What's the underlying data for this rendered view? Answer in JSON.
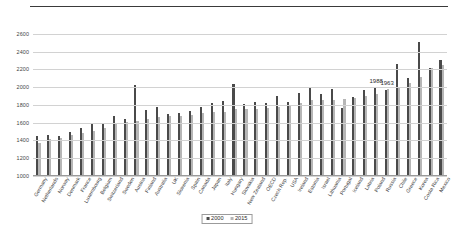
{
  "chart_data": {
    "type": "bar",
    "title": "",
    "subtitle": "",
    "xlabel": "",
    "ylabel": "",
    "ylim": [
      1000,
      2700
    ],
    "yticks": [
      1000,
      1200,
      1400,
      1600,
      1800,
      2000,
      2200,
      2400,
      2600
    ],
    "ytick_labels": [
      "1000",
      "1200",
      "1400",
      "1600",
      "1800",
      "2000",
      "2200",
      "2400",
      "2600"
    ],
    "grid": "horizontal",
    "legend_position": "bottom-center",
    "categories": [
      "Germany",
      "Netherlands",
      "Norway",
      "Denmark",
      "France",
      "Luxembourg",
      "Belgium",
      "Switzerland",
      "Sweden",
      "Austria",
      "Finland",
      "Australia",
      "UK",
      "Slovenia",
      "Spain",
      "Canada",
      "Japan",
      "Italy",
      "Hungary",
      "Slovakia",
      "New Zealand",
      "OECD",
      "Czech Rep.",
      "USA",
      "Ireland",
      "Estonia",
      "Israel",
      "Lithuania",
      "Portugal",
      "Iceland",
      "Latvia",
      "Poland",
      "Russia",
      "Chile",
      "Greece",
      "Korea",
      "Costa Rica",
      "Mexico"
    ],
    "series": [
      {
        "name": "2000",
        "color": "#4a4a4a",
        "values": [
          1452,
          1463,
          1455,
          1491,
          1535,
          1601,
          1595,
          1673,
          1642,
          2020,
          1744,
          1778,
          1700,
          1705,
          1731,
          1779,
          1821,
          1849,
          2033,
          1816,
          1836,
          1821,
          1896,
          1832,
          1933,
          1990,
          1920,
          1982,
          1769,
          1885,
          1974,
          1988,
          1963,
          2263,
          2098,
          2512,
          2216,
          2311
        ]
      },
      {
        "name": "2015",
        "color": "#b6b6b6",
        "values": [
          1371,
          1419,
          1424,
          1457,
          1482,
          1507,
          1541,
          1590,
          1612,
          1625,
          1646,
          1665,
          1674,
          1676,
          1691,
          1706,
          1719,
          1725,
          1749,
          1754,
          1757,
          1766,
          1779,
          1790,
          1820,
          1852,
          1858,
          1860,
          1868,
          1880,
          1903,
          1928,
          1978,
          1988,
          2042,
          2113,
          2216,
          2246
        ]
      }
    ],
    "annotations": [
      {
        "text": "1988",
        "category": "Poland",
        "series": "2000",
        "value": 1988
      },
      {
        "text": "1963",
        "category": "Russia",
        "series": "2000",
        "value": 1963
      }
    ]
  },
  "legend": {
    "items": [
      {
        "label": "2000",
        "color": "#4a4a4a"
      },
      {
        "label": "2015",
        "color": "#b6b6b6"
      }
    ]
  }
}
